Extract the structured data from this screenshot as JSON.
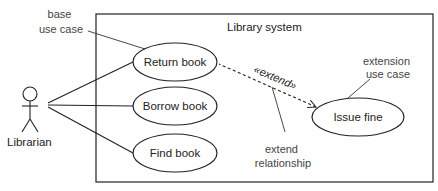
{
  "diagram": {
    "type": "uml-use-case",
    "system": {
      "title": "Library system"
    },
    "actor": {
      "name": "Librarian"
    },
    "use_cases": [
      {
        "id": "return",
        "label": "Return book"
      },
      {
        "id": "borrow",
        "label": "Borrow book"
      },
      {
        "id": "find",
        "label": "Find book"
      },
      {
        "id": "fine",
        "label": "Issue fine"
      }
    ],
    "relationships": [
      {
        "from": "Librarian",
        "to": "Return book",
        "kind": "association"
      },
      {
        "from": "Librarian",
        "to": "Borrow book",
        "kind": "association"
      },
      {
        "from": "Librarian",
        "to": "Find book",
        "kind": "association"
      },
      {
        "from": "Issue fine",
        "to": "Return book",
        "kind": "extend",
        "label": "«extend»"
      }
    ],
    "annotations": {
      "base_use_case": [
        "base",
        "use case"
      ],
      "extension_use_case": [
        "extension",
        "use case"
      ],
      "extend_relationship": [
        "extend",
        "relationship"
      ]
    },
    "colors": {
      "stroke": "#222222",
      "annotation_text": "#444444",
      "background": "#ffffff"
    }
  }
}
